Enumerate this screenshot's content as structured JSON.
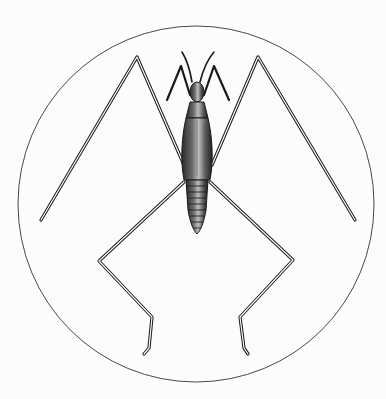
{
  "image": {
    "subject": "engraved illustration of a long-legged water strider insect inside a circular frame",
    "background_color": "#fcfcfa",
    "ink_color": "#1a1a1a",
    "frame": {
      "shape": "circle",
      "cx": 196,
      "cy": 204,
      "r": 178
    }
  }
}
